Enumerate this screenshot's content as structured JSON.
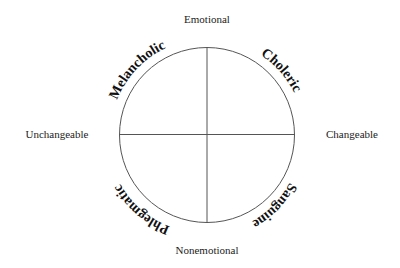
{
  "diagram": {
    "axes": {
      "top": "Emotional",
      "bottom": "Nonemotional",
      "left": "Unchangeable",
      "right": "Changeable"
    },
    "quadrants": {
      "top_left": "Melancholic",
      "top_right": "Choleric",
      "bottom_right": "Sanguine",
      "bottom_left": "Phlegmatic"
    },
    "colors": {
      "line": "#555555",
      "text": "#111111"
    }
  }
}
